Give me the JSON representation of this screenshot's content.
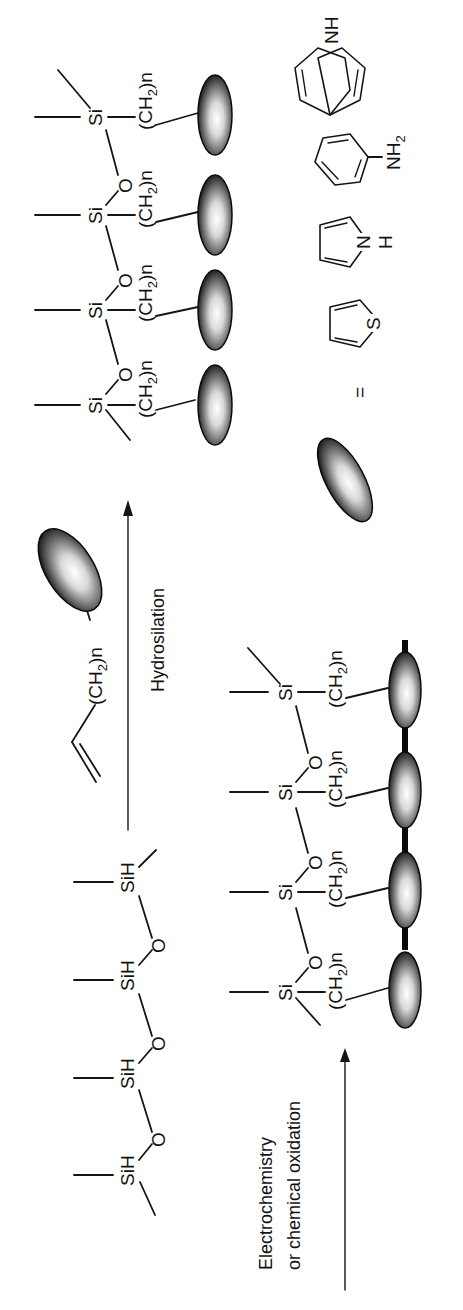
{
  "figure": {
    "orientation": "rotated -90deg (text reads bottom-to-top)",
    "reaction_step_1": {
      "label": "Hydrosilation",
      "arrow_direction": "right"
    },
    "reaction_step_2": {
      "label_line_1": "Electrochemistry",
      "label_line_2": "or chemical oxidation",
      "arrow_direction": "right"
    },
    "starting_polymer": {
      "repeat_units": 4,
      "atoms": [
        "SiH",
        "SiH",
        "SiH",
        "SiH"
      ],
      "linker_atom": "O"
    },
    "reagent": {
      "spacer_label": "(CH",
      "spacer_sub": "2",
      "spacer_suffix": ")n"
    },
    "grafted_polymer": {
      "atom": "Si",
      "linker_atom": "O",
      "spacer_label": "(CH",
      "spacer_sub": "2",
      "spacer_suffix": ")n",
      "pendant_groups": 4
    },
    "crosslinked_polymer": {
      "atom": "Si",
      "linker_atom": "O",
      "spacer_label": "(CH",
      "spacer_sub": "2",
      "spacer_suffix": ")n",
      "pendant_groups": 4,
      "linked": true
    },
    "legend": {
      "equals": "=",
      "monomers": [
        {
          "name": "thiophene",
          "heteroatom": "S"
        },
        {
          "name": "pyrrole",
          "heteroatom": "NH",
          "het_1": "N",
          "het_2": "H"
        },
        {
          "name": "aniline",
          "substituent": "NH",
          "substituent_sub": "2"
        },
        {
          "name": "carbazole",
          "heteroatom": "NH"
        }
      ]
    }
  }
}
